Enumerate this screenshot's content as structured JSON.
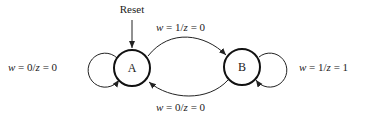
{
  "diagram": {
    "type": "finite-state-machine",
    "reset_label": "Reset",
    "states": [
      {
        "id": "A",
        "label": "A"
      },
      {
        "id": "B",
        "label": "B"
      }
    ],
    "transitions": [
      {
        "from": "A",
        "to": "A",
        "w": "0",
        "z": "0",
        "label_w": "w",
        "label_rest": " = 0/",
        "label_z": "z",
        "label_tail": " = 0"
      },
      {
        "from": "A",
        "to": "B",
        "w": "1",
        "z": "0",
        "label_w": "w",
        "label_rest": " = 1/",
        "label_z": "z",
        "label_tail": " = 0"
      },
      {
        "from": "B",
        "to": "A",
        "w": "0",
        "z": "0",
        "label_w": "w",
        "label_rest": " = 0/",
        "label_z": "z",
        "label_tail": " = 0"
      },
      {
        "from": "B",
        "to": "B",
        "w": "1",
        "z": "1",
        "label_w": "w",
        "label_rest": " = 1/",
        "label_z": "z",
        "label_tail": " = 1"
      }
    ],
    "colors": {
      "stroke": "#222222",
      "background": "#ffffff"
    }
  }
}
